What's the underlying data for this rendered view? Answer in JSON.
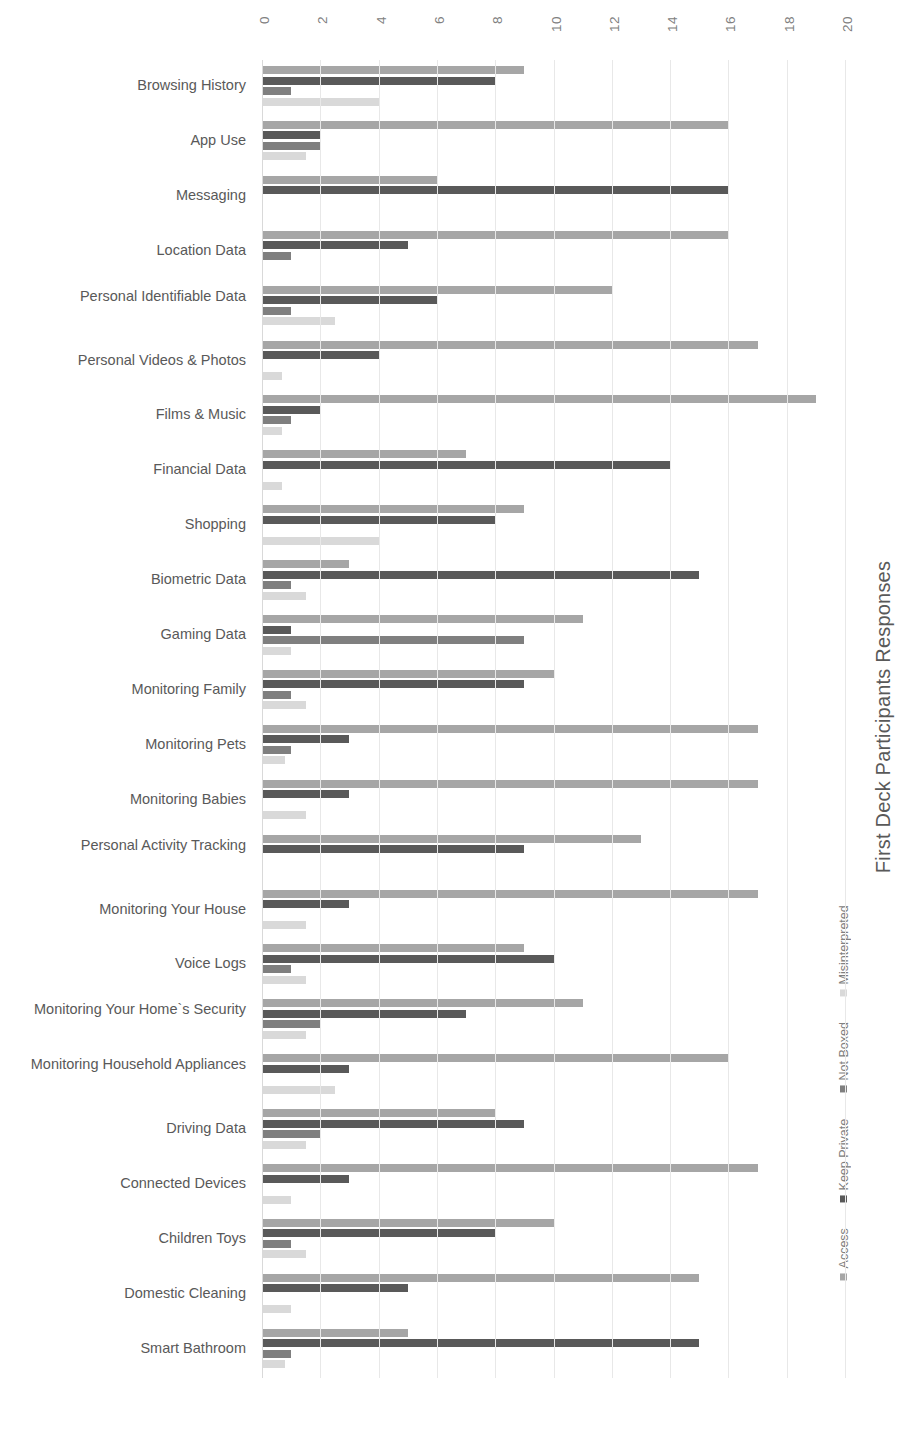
{
  "chart_data": {
    "type": "bar",
    "orientation": "horizontal",
    "title": "First Deck Participants Responses",
    "xlabel": "",
    "ylabel": "",
    "xlim": [
      0,
      20
    ],
    "xticks": [
      "0",
      "2",
      "4",
      "6",
      "8",
      "10",
      "12",
      "14",
      "16",
      "18",
      "20"
    ],
    "grid": true,
    "legend_position": "right",
    "legend": [
      "Access",
      "Keep Private",
      "Not Boxed",
      "Misinterpreted"
    ],
    "colors": {
      "Access": "#a6a6a6",
      "Keep Private": "#595959",
      "Not Boxed": "#7f7f7f",
      "Misinterpreted": "#d9d9d9"
    },
    "categories": [
      "Browsing History",
      "App Use",
      "Messaging",
      "Location Data",
      "Personal Identifiable Data",
      "Personal Videos & Photos",
      "Films & Music",
      "Financial Data",
      "Shopping",
      "Biometric Data",
      "Gaming Data",
      "Monitoring Family",
      "Monitoring Pets",
      "Monitoring Babies",
      "Personal Activity Tracking",
      "Monitoring Your House",
      "Voice Logs",
      "Monitoring Your Home`s Security",
      "Monitoring Household Appliances",
      "Driving Data",
      "Connected Devices",
      "Children Toys",
      "Domestic Cleaning",
      "Smart Bathroom"
    ],
    "series": [
      {
        "name": "Access",
        "values": [
          9,
          16,
          6,
          16,
          12,
          17,
          19,
          7,
          9,
          3,
          11,
          10,
          17,
          17,
          13,
          17,
          9,
          11,
          16,
          8,
          17,
          10,
          15,
          5
        ]
      },
      {
        "name": "Keep Private",
        "values": [
          8,
          2,
          16,
          5,
          6,
          4,
          2,
          14,
          8,
          15,
          1,
          9,
          3,
          3,
          9,
          3,
          10,
          7,
          3,
          9,
          3,
          8,
          5,
          15
        ]
      },
      {
        "name": "Not Boxed",
        "values": [
          1,
          2,
          0,
          1,
          1,
          0,
          1,
          0,
          0,
          1,
          9,
          1,
          1,
          0,
          0,
          0,
          1,
          2,
          0,
          2,
          0,
          1,
          0,
          1
        ]
      },
      {
        "name": "Misinterpreted",
        "values": [
          4,
          1.5,
          0,
          0,
          2.5,
          0.7,
          0.7,
          0.7,
          4,
          1.5,
          1,
          1.5,
          0.8,
          1.5,
          0,
          1.5,
          1.5,
          1.5,
          2.5,
          1.5,
          1,
          1.5,
          1,
          0.8
        ]
      }
    ]
  }
}
